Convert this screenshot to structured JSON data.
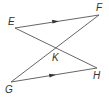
{
  "diagram": {
    "type": "geometry",
    "line_color": "#555555",
    "points": {
      "E": {
        "label": "E",
        "x": 15,
        "y": 28,
        "lx": 8,
        "ly": 25
      },
      "F": {
        "label": "F",
        "x": 99,
        "y": 15,
        "lx": 96,
        "ly": 11
      },
      "G": {
        "label": "G",
        "x": 11,
        "y": 82,
        "lx": 5,
        "ly": 93
      },
      "H": {
        "label": "H",
        "x": 97,
        "y": 68,
        "lx": 93,
        "ly": 79
      },
      "K": {
        "label": "K",
        "x": 55,
        "y": 48,
        "lx": 52,
        "ly": 61
      }
    },
    "segments": [
      {
        "from": "E",
        "to": "F",
        "parallel_marker": true
      },
      {
        "from": "G",
        "to": "H",
        "parallel_marker": true
      },
      {
        "from": "E",
        "to": "H",
        "parallel_marker": false
      },
      {
        "from": "G",
        "to": "F",
        "parallel_marker": false
      }
    ]
  }
}
